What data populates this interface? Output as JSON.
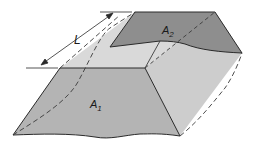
{
  "figure": {
    "type": "prismatoid-volume-diagram",
    "labels": {
      "length": "L",
      "area1_main": "A",
      "area1_sub": "1",
      "area2_main": "A",
      "area2_sub": "2"
    },
    "colors": {
      "background": "#ffffff",
      "face_a1": "#b4b4b4",
      "face_a2": "#8e8e8e",
      "top_face": "#d9d9d9",
      "right_face": "#cfcfcf",
      "outline": "#2a2a2a",
      "hidden_line": "#3a3a3a"
    }
  }
}
